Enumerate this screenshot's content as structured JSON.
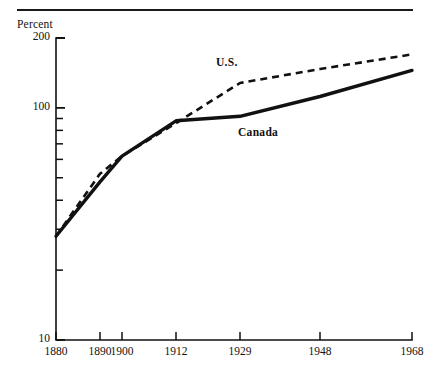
{
  "figure": {
    "percent_axis_caption": "Percent",
    "top_rule": true
  },
  "chart_data": {
    "type": "line",
    "title": "",
    "subtitle": "",
    "xlabel": "",
    "ylabel": "Percent",
    "yscale": "log",
    "ylim": [
      10,
      200
    ],
    "ytick_labels": [
      "200",
      "100",
      "10"
    ],
    "ytick_values": [
      200,
      100,
      10
    ],
    "grid": false,
    "legend": "inline-annotations",
    "categories": [
      "1880",
      "1890",
      "1900",
      "1912",
      "1929",
      "1948",
      "1968"
    ],
    "x": [
      1880,
      1890,
      1900,
      1912,
      1929,
      1948,
      1968
    ],
    "series": [
      {
        "name": "U.S.",
        "style": "dashed",
        "values": [
          28,
          52,
          62,
          86,
          128,
          147,
          170
        ]
      },
      {
        "name": "Canada",
        "style": "solid",
        "values": [
          28,
          48,
          62,
          88,
          92,
          112,
          145
        ]
      }
    ],
    "annotations": [
      {
        "text": "U.S.",
        "series": "U.S."
      },
      {
        "text": "Canada",
        "series": "Canada"
      }
    ]
  }
}
